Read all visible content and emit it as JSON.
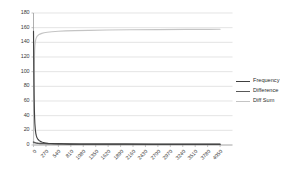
{
  "chart_data": {
    "type": "line",
    "title": "",
    "xlabel": "",
    "ylabel": "",
    "xlim": [
      0,
      4320
    ],
    "ylim": [
      0,
      180
    ],
    "grid": true,
    "grid_axis": "y",
    "legend_position": "right",
    "y_ticks": [
      0,
      20,
      40,
      60,
      80,
      100,
      120,
      140,
      160,
      180
    ],
    "x_ticks": [
      0,
      270,
      540,
      810,
      1080,
      1350,
      1620,
      1890,
      2160,
      2430,
      2700,
      2970,
      3240,
      3510,
      3780,
      4050
    ],
    "x_tick_labels": [
      "0",
      "270",
      "540",
      "810",
      "1080",
      "1350",
      "1620",
      "1890",
      "2160",
      "2430",
      "2700",
      "2970",
      "3240",
      "3510",
      "3780",
      "4050"
    ],
    "y_tick_labels": [
      "0",
      "20",
      "40",
      "60",
      "80",
      "100",
      "120",
      "140",
      "160",
      "180"
    ],
    "series": [
      {
        "name": "Frequency",
        "color": "#404040",
        "x": [
          0,
          5,
          10,
          15,
          20,
          25,
          30,
          40,
          50,
          60,
          70,
          80,
          90,
          100,
          120,
          140,
          160,
          180,
          200,
          240,
          280,
          320,
          380,
          440,
          540,
          650,
          800,
          1000,
          1300,
          1700,
          2200,
          2800,
          3400,
          4050
        ],
        "values": [
          155,
          120,
          86,
          62,
          46,
          36,
          29,
          21,
          16,
          13,
          11,
          9.5,
          8.4,
          7.5,
          6.2,
          5.3,
          4.6,
          4.1,
          3.7,
          3.1,
          2.7,
          2.4,
          2.1,
          1.8,
          1.5,
          1.3,
          1.1,
          1.0,
          1.0,
          1.0,
          1.0,
          1.0,
          1.0,
          1.0
        ]
      },
      {
        "name": "Difference",
        "color": "#595959",
        "x": [
          0,
          20,
          40,
          60,
          80,
          100,
          140,
          180,
          240,
          320,
          440,
          600,
          800,
          1100,
          1500,
          2000,
          2600,
          3200,
          3800,
          4050
        ],
        "values": [
          4.0,
          3.4,
          3.0,
          2.7,
          2.5,
          2.3,
          2.1,
          2.0,
          1.9,
          1.8,
          1.7,
          1.6,
          1.5,
          1.4,
          1.3,
          1.2,
          1.1,
          1.0,
          1.0,
          1.0
        ]
      },
      {
        "name": "Diff Sum",
        "color": "#c4c4c4",
        "x": [
          0,
          5,
          10,
          15,
          20,
          25,
          30,
          40,
          50,
          60,
          75,
          90,
          110,
          140,
          180,
          230,
          300,
          400,
          540,
          700,
          900,
          1200,
          1600,
          2100,
          2700,
          3300,
          3800,
          4050
        ],
        "values": [
          0,
          40,
          78,
          103,
          119,
          129,
          135,
          141,
          144,
          146,
          148,
          149,
          150.2,
          151.2,
          152.2,
          153.0,
          153.8,
          154.5,
          155.1,
          155.6,
          156.0,
          156.4,
          156.8,
          157.1,
          157.4,
          157.6,
          157.7,
          157.8
        ]
      }
    ]
  },
  "legend": {
    "items": [
      {
        "label": "Frequency",
        "color": "#404040"
      },
      {
        "label": "Difference",
        "color": "#595959"
      },
      {
        "label": "Diff Sum",
        "color": "#c4c4c4"
      }
    ]
  },
  "axes": {
    "axis_color": "#9a9a9a",
    "grid_color": "#d9d9d9",
    "tick_text_color": "#3a3a3a"
  }
}
